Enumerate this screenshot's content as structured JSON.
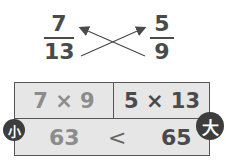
{
  "fractions": {
    "left": {
      "numerator": "7",
      "denominator": "13"
    },
    "right": {
      "numerator": "5",
      "denominator": "9"
    }
  },
  "cross_multiplication": {
    "left_product": "7 × 9",
    "right_product": "5 × 13",
    "left_result": "63",
    "operator": "<",
    "right_result": "65"
  },
  "badges": {
    "small": "小",
    "big": "大"
  },
  "colors": {
    "dark_text": "#4a4a4a",
    "light_text": "#8c8c8c",
    "box_fill": "#e6e6e6",
    "badge_fill": "#3d3d3d"
  }
}
